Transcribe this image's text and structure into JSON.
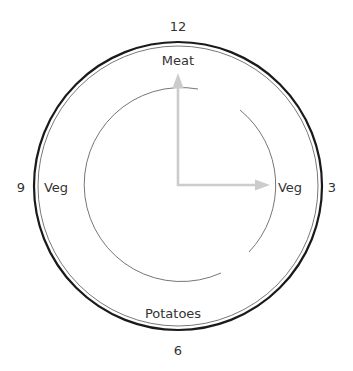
{
  "clock": {
    "hour_labels": {
      "top": "12",
      "right": "3",
      "bottom": "6",
      "left": "9"
    },
    "plate_labels": {
      "top": "Meat",
      "right": "Veg",
      "bottom": "Potatoes",
      "left": "Veg"
    },
    "colors": {
      "rim": "#1a1a1a",
      "inner_ring": "#555555",
      "arc": "#666666",
      "hands": "#cccccc",
      "text": "#333333"
    }
  },
  "caption": {
    "text": ""
  }
}
